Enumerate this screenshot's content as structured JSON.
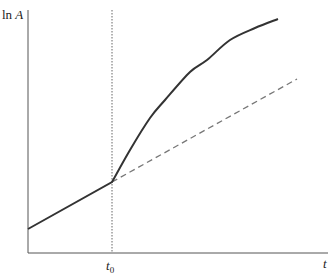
{
  "chart_data": {
    "type": "line",
    "title": "",
    "xlabel": "t",
    "ylabel": "ln A",
    "ylabel_parts": {
      "fn": "ln",
      "var": "A"
    },
    "x_ticks": [
      {
        "label": "t",
        "subscript": "0",
        "position": "t0"
      }
    ],
    "grid": false,
    "legend": null,
    "annotations": [
      {
        "type": "vertical-dotted-line",
        "at": "t0"
      }
    ],
    "series": [
      {
        "name": "ln A (actual path)",
        "style": "solid",
        "description": "Linear growth before t0, then a kink to a steeper concave curve after t0",
        "points_px": [
          [
            28,
            229
          ],
          [
            112,
            182
          ],
          [
            130,
            150
          ],
          [
            150,
            118
          ],
          [
            165,
            100
          ],
          [
            190,
            72
          ],
          [
            207,
            60
          ],
          [
            230,
            40
          ],
          [
            255,
            28
          ],
          [
            278,
            19
          ]
        ]
      },
      {
        "name": "ln A (pre-t0 trend extrapolated)",
        "style": "dashed",
        "description": "Continuation of the pre-t0 linear trend after t0",
        "points_px": [
          [
            112,
            182
          ],
          [
            297,
            79
          ]
        ]
      }
    ],
    "axis_px": {
      "origin": [
        28,
        253
      ],
      "x_end": 328,
      "y_top": 10,
      "t0_x": 112
    }
  }
}
